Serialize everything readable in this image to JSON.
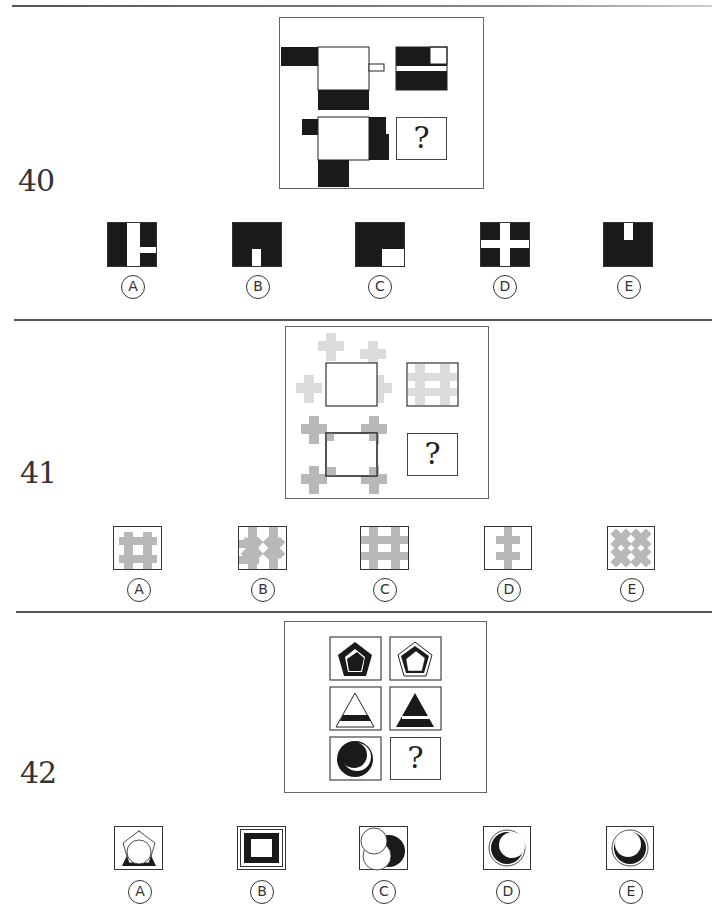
{
  "questions": [
    {
      "number": "40",
      "question_mark": "?",
      "options": [
        {
          "label": "A",
          "description": "black square with white vertical bar and white horizontal stub to the right"
        },
        {
          "label": "B",
          "description": "black square with small white rectangle at bottom center"
        },
        {
          "label": "C",
          "description": "black square with white rectangle at bottom-right corner"
        },
        {
          "label": "D",
          "description": "black square with white cross"
        },
        {
          "label": "E",
          "description": "black square with small white rectangle at top center"
        }
      ]
    },
    {
      "number": "41",
      "question_mark": "?",
      "options": [
        {
          "label": "A",
          "description": "grey hash sign, framed"
        },
        {
          "label": "B",
          "description": "grey overlapping crosses, framed"
        },
        {
          "label": "C",
          "description": "grey hash sign filling frame"
        },
        {
          "label": "D",
          "description": "grey vertical bar with two crossbars"
        },
        {
          "label": "E",
          "description": "grey diagonal X pattern"
        }
      ]
    },
    {
      "number": "42",
      "question_mark": "?",
      "options": [
        {
          "label": "A",
          "description": "circle over triangle and pentagon outline"
        },
        {
          "label": "B",
          "description": "concentric squares with thick black band"
        },
        {
          "label": "C",
          "description": "white circle overlapping black circle"
        },
        {
          "label": "D",
          "description": "black crescent in double-outlined circle, opening right"
        },
        {
          "label": "E",
          "description": "black crescent in double-outlined circle, opening top"
        }
      ]
    }
  ],
  "colors": {
    "ink": "#1a1a1a",
    "grey_shape": "#b8b8b8",
    "light_grey_shape": "#dcdcdc",
    "rule": "#555555"
  }
}
